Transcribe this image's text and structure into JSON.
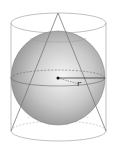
{
  "diagram": {
    "shapes": [
      "cylinder",
      "sphere",
      "cone"
    ],
    "labels": {
      "radius": "r"
    },
    "colors": {
      "outline": "#9a9a9a",
      "sphere_light": "#f4f4f4",
      "sphere_dark": "#8c8c8c",
      "radius_line": "#222222",
      "center_dot": "#111111"
    }
  }
}
